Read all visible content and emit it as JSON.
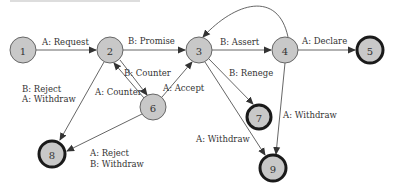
{
  "header": {
    "text": ""
  },
  "colors": {
    "node_fill": "#c8c8c8",
    "node_stroke": "#555555",
    "final_stroke": "#1a1a1a",
    "edge": "#555555",
    "text": "#333333"
  },
  "nodes": [
    {
      "id": "1",
      "label": "1",
      "x": 23,
      "y": 50,
      "final": false
    },
    {
      "id": "2",
      "label": "2",
      "x": 110,
      "y": 50,
      "final": false
    },
    {
      "id": "3",
      "label": "3",
      "x": 199,
      "y": 50,
      "final": false
    },
    {
      "id": "4",
      "label": "4",
      "x": 285,
      "y": 50,
      "final": false
    },
    {
      "id": "5",
      "label": "5",
      "x": 370,
      "y": 50,
      "final": true
    },
    {
      "id": "6",
      "label": "6",
      "x": 153,
      "y": 107,
      "final": false
    },
    {
      "id": "7",
      "label": "7",
      "x": 259,
      "y": 117,
      "final": true
    },
    {
      "id": "8",
      "label": "8",
      "x": 52,
      "y": 154,
      "final": true
    },
    {
      "id": "9",
      "label": "9",
      "x": 273,
      "y": 168,
      "final": true
    }
  ],
  "edges": [
    {
      "from": "1",
      "to": "2",
      "label": [
        "A: Request"
      ]
    },
    {
      "from": "2",
      "to": "3",
      "label": [
        "B: Promise"
      ]
    },
    {
      "from": "3",
      "to": "4",
      "label": [
        "B: Assert"
      ]
    },
    {
      "from": "4",
      "to": "5",
      "label": [
        "A: Declare"
      ]
    },
    {
      "from": "4",
      "to": "3",
      "label": [],
      "curved": true
    },
    {
      "from": "2",
      "to": "6",
      "label": [
        "B: Counter"
      ]
    },
    {
      "from": "6",
      "to": "2",
      "label": [
        "A: Counter"
      ]
    },
    {
      "from": "6",
      "to": "3",
      "label": [
        "A: Accept"
      ]
    },
    {
      "from": "3",
      "to": "7",
      "label": [
        "B: Renege"
      ]
    },
    {
      "from": "3",
      "to": "9",
      "label": [
        "A: Withdraw"
      ]
    },
    {
      "from": "4",
      "to": "9",
      "label": [
        "A: Withdraw"
      ]
    },
    {
      "from": "2",
      "to": "8",
      "label": [
        "B: Reject",
        "A: Withdraw"
      ]
    },
    {
      "from": "6",
      "to": "8",
      "label": [
        "A: Reject",
        "B: Withdraw"
      ]
    }
  ],
  "labels": {
    "e_1_2": "A: Request",
    "e_2_3": "B: Promise",
    "e_3_4": "B: Assert",
    "e_4_5": "A: Declare",
    "e_2_6": "B: Counter",
    "e_6_2": "A: Counter",
    "e_6_3": "A: Accept",
    "e_3_7": "B: Renege",
    "e_3_9": "A: Withdraw",
    "e_4_9": "A: Withdraw",
    "e_2_8_line1": "B: Reject",
    "e_2_8_line2": "A: Withdraw",
    "e_6_8_line1": "A: Reject",
    "e_6_8_line2": "B: Withdraw"
  }
}
